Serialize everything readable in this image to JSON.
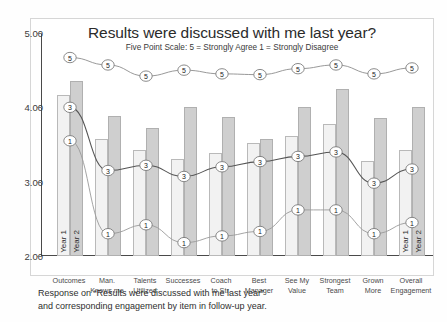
{
  "chart_data": {
    "type": "bar",
    "title": "Results were discussed with me last year?",
    "subtitle": "Five Point Scale:  5 = Strongly Agree   1 = Strongly Disagree",
    "xlabel": "",
    "ylabel": "",
    "ylim": [
      2.0,
      5.0
    ],
    "ytick_labels": [
      "5.00",
      "4.00",
      "3.00",
      "2.00"
    ],
    "ytick_values": [
      5.0,
      4.0,
      3.0,
      2.0
    ],
    "grid": false,
    "legend_position": "in-bar",
    "categories": [
      "Outcomes",
      "Man. Knows me",
      "Talents Utilized",
      "Successes",
      "Coach to Str.",
      "Best Manager",
      "See My Value",
      "Strongest Team",
      "Grown More",
      "Overall Engagement"
    ],
    "categories_wrapped": [
      {
        "l1": "Outcomes",
        "l2": ""
      },
      {
        "l1": "Man.",
        "l2": "Knows me"
      },
      {
        "l1": "Talents",
        "l2": "Utilized"
      },
      {
        "l1": "Successes",
        "l2": ""
      },
      {
        "l1": "Coach",
        "l2": "to Str."
      },
      {
        "l1": "Best",
        "l2": "Manager"
      },
      {
        "l1": "See My",
        "l2": "Value"
      },
      {
        "l1": "Strongest",
        "l2": "Team"
      },
      {
        "l1": "Grown",
        "l2": "More"
      },
      {
        "l1": "Overall",
        "l2": "Engagement"
      }
    ],
    "bar_series": [
      {
        "name": "Year 1",
        "color": "#f2f2f2",
        "values": [
          4.17,
          3.57,
          3.42,
          3.3,
          3.38,
          3.52,
          3.62,
          3.77,
          3.28,
          3.42
        ]
      },
      {
        "name": "Year 2",
        "color": "#cfcfcf",
        "values": [
          4.35,
          3.88,
          3.72,
          4.0,
          3.87,
          3.57,
          4.0,
          4.25,
          3.85,
          4.0
        ]
      }
    ],
    "line_series": [
      {
        "name": "5 = Strongly Agree",
        "label": "5",
        "values": [
          4.67,
          4.57,
          4.42,
          4.5,
          4.45,
          4.44,
          4.52,
          4.57,
          4.45,
          4.53
        ]
      },
      {
        "name": "3 = Neutral",
        "label": "3",
        "values": [
          4.0,
          3.15,
          3.22,
          3.07,
          3.2,
          3.27,
          3.34,
          3.4,
          2.98,
          3.17
        ]
      },
      {
        "name": "1 = Strongly Disagree",
        "label": "1",
        "values": [
          3.55,
          2.3,
          2.42,
          2.18,
          2.27,
          2.33,
          2.62,
          2.62,
          2.3,
          2.45
        ]
      }
    ],
    "in_bar_labels": {
      "first_group": [
        "Year 1",
        "Year 2"
      ],
      "last_group": [
        "Year 1",
        "Year 2"
      ]
    }
  },
  "caption": {
    "line1": "Response on “Results were discussed with me last year”",
    "line2": "and corresponding engagement by item in follow-up year."
  }
}
